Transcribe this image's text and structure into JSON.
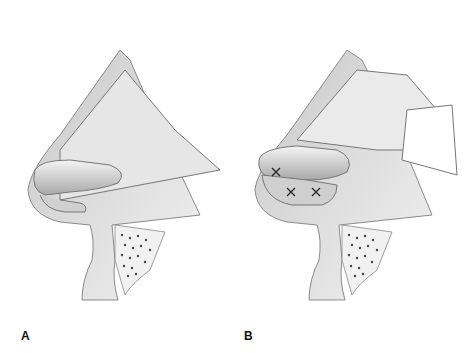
{
  "figure": {
    "panels": [
      {
        "label": "A",
        "description": "Lateral view of nose with dorsal skin flap elevated; cartilage graft positioned at nasal tip"
      },
      {
        "label": "B",
        "description": "Lateral view of nose with graft sutured in place at nasal tip, sutures marked with X"
      }
    ],
    "colors": {
      "skin_fill": "#d9d9d9",
      "skin_edge": "#8a8a8a",
      "graft_fill": "#cfcfcf",
      "bone_dots": "#444444",
      "suture": "#222222"
    }
  }
}
